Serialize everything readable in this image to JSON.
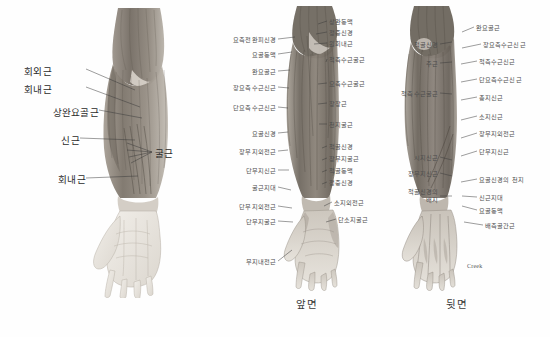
{
  "figure": {
    "signature": "Creek"
  },
  "captions": {
    "front": "앞면",
    "back": "뒷면"
  },
  "panels": [
    {
      "id": "overview",
      "name": "overview-arm",
      "labels": [
        {
          "text": "회외근",
          "x": 52,
          "y": 71,
          "side": "right"
        },
        {
          "text": "회내근",
          "x": 52,
          "y": 89,
          "side": "right"
        },
        {
          "text": "상완요골근",
          "x": 40,
          "y": 112,
          "side": "right"
        },
        {
          "text": "신근",
          "x": 60,
          "y": 140,
          "side": "right"
        },
        {
          "text": "회내근",
          "x": 52,
          "y": 180,
          "side": "right"
        },
        {
          "text": "굴근",
          "x": 156,
          "y": 152,
          "side": "left"
        }
      ]
    },
    {
      "id": "front",
      "name": "front-view",
      "left_labels": [
        {
          "text": "요측전완피신경",
          "x": 276,
          "y": 40
        },
        {
          "text": "요골동맥",
          "x": 276,
          "y": 55
        },
        {
          "text": "완요골근",
          "x": 276,
          "y": 72
        },
        {
          "text": "장요측수근신근",
          "x": 276,
          "y": 88
        },
        {
          "text": "단요측수근신근",
          "x": 276,
          "y": 108
        },
        {
          "text": "요골신경",
          "x": 276,
          "y": 134
        },
        {
          "text": "장무지외전근",
          "x": 276,
          "y": 152
        },
        {
          "text": "단무지신근",
          "x": 276,
          "y": 171
        },
        {
          "text": "굴근지대",
          "x": 276,
          "y": 188
        },
        {
          "text": "단무지외전근",
          "x": 276,
          "y": 207
        },
        {
          "text": "단무지굴근",
          "x": 276,
          "y": 222
        },
        {
          "text": "무지내전근",
          "x": 276,
          "y": 262
        }
      ],
      "right_labels": [
        {
          "text": "상완동맥",
          "x": 329,
          "y": 22
        },
        {
          "text": "정중신경",
          "x": 329,
          "y": 33
        },
        {
          "text": "원회내근",
          "x": 329,
          "y": 44
        },
        {
          "text": "척측수근굴근",
          "x": 329,
          "y": 60
        },
        {
          "text": "요측수근굴근",
          "x": 329,
          "y": 84
        },
        {
          "text": "장장근",
          "x": 329,
          "y": 104
        },
        {
          "text": "천지굴근",
          "x": 329,
          "y": 125
        },
        {
          "text": "척골신경",
          "x": 329,
          "y": 147
        },
        {
          "text": "장무지굴근",
          "x": 329,
          "y": 159
        },
        {
          "text": "척골동맥",
          "x": 329,
          "y": 171
        },
        {
          "text": "정중신경",
          "x": 329,
          "y": 183
        },
        {
          "text": "소지외전근",
          "x": 334,
          "y": 203
        },
        {
          "text": "단소지굴근",
          "x": 338,
          "y": 220
        }
      ]
    },
    {
      "id": "back",
      "name": "back-view",
      "left_labels": [
        {
          "text": "척골신경",
          "x": 438,
          "y": 45
        },
        {
          "text": "주근",
          "x": 438,
          "y": 64
        },
        {
          "text": "척측수근굴근",
          "x": 438,
          "y": 94
        },
        {
          "text": "시지신근",
          "x": 438,
          "y": 158
        },
        {
          "text": "장무지신근",
          "x": 438,
          "y": 174
        },
        {
          "text": "척골신경의",
          "x": 438,
          "y": 192
        },
        {
          "text": "배지",
          "x": 438,
          "y": 200
        }
      ],
      "right_labels": [
        {
          "text": "완요골근",
          "x": 476,
          "y": 28
        },
        {
          "text": "장요측수근신근",
          "x": 483,
          "y": 45
        },
        {
          "text": "척측수근신근",
          "x": 479,
          "y": 62
        },
        {
          "text": "단요측수근신근",
          "x": 479,
          "y": 80
        },
        {
          "text": "총지신근",
          "x": 479,
          "y": 98
        },
        {
          "text": "소지신근",
          "x": 479,
          "y": 117
        },
        {
          "text": "장무지외전근",
          "x": 479,
          "y": 134
        },
        {
          "text": "단무지신근",
          "x": 479,
          "y": 152
        },
        {
          "text": "요골신경의 천지",
          "x": 479,
          "y": 180
        },
        {
          "text": "신근지대",
          "x": 479,
          "y": 198
        },
        {
          "text": "요골동맥",
          "x": 479,
          "y": 211
        },
        {
          "text": "배측골간근",
          "x": 485,
          "y": 226
        }
      ]
    }
  ],
  "colors": {
    "muscle_dark": "#6b6259",
    "muscle_mid": "#8d857b",
    "muscle_light": "#b3ada3",
    "skin": "#e8e4dd",
    "outline": "#5a544c",
    "label_text": "#4d4d4d",
    "background": "#ffffff"
  }
}
